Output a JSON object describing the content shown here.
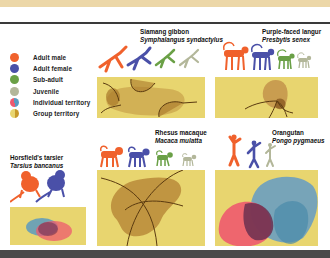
{
  "legend": {
    "items": [
      {
        "label": "Adult male",
        "color": "#f0612c",
        "icon": "adult-male-dot"
      },
      {
        "label": "Adult female",
        "color": "#4a50a8",
        "icon": "adult-female-dot"
      },
      {
        "label": "Sub-adult",
        "color": "#6aa046",
        "icon": "sub-adult-dot"
      },
      {
        "label": "Juvenile",
        "color": "#b3b79a",
        "icon": "juvenile-dot"
      },
      {
        "label": "Individual territory",
        "color": "#d86070",
        "icon": "individual-territory-dot"
      },
      {
        "label": "Group territory",
        "color": "#e8c648",
        "icon": "group-territory-dot"
      }
    ]
  },
  "species": [
    {
      "id": "siamang",
      "common": "Siamang gibbon",
      "scientific": "Symphalangus syndactylus",
      "territory": "group"
    },
    {
      "id": "langur",
      "common": "Purple-faced langur",
      "scientific": "Presbytis senex",
      "territory": "group"
    },
    {
      "id": "tarsier",
      "common": "Horsfield's tarsier",
      "scientific": "Tarsius bancanus",
      "territory": "individual"
    },
    {
      "id": "macaque",
      "common": "Rhesus macaque",
      "scientific": "Macaca mulatta",
      "territory": "group"
    },
    {
      "id": "orangutan",
      "common": "Orangutan",
      "scientific": "Pongo pygmaeus",
      "territory": "individual"
    }
  ],
  "colors": {
    "panel_bg": "#e8d56f",
    "group_territory": "#b88a3a",
    "individual_red": "#ee5a6e",
    "individual_blue": "#5a9ac0",
    "overlap": "#6a3050"
  }
}
